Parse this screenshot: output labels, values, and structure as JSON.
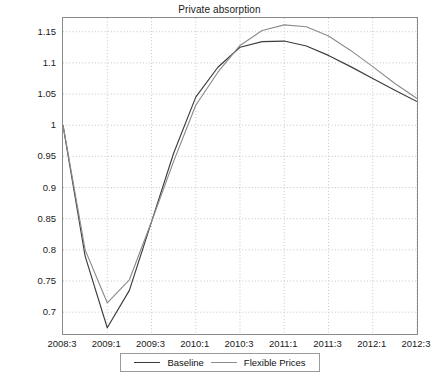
{
  "chart_data": {
    "type": "line",
    "title": "Private absorption",
    "xlabel": "",
    "ylabel": "",
    "grid": true,
    "legend_position": "bottom-center",
    "x": [
      "2008:3",
      "2008:4",
      "2009:1",
      "2009:2",
      "2009:3",
      "2009:4",
      "2010:1",
      "2010:2",
      "2010:3",
      "2010:4",
      "2011:1",
      "2011:2",
      "2011:3",
      "2011:4",
      "2012:1",
      "2012:2",
      "2012:3"
    ],
    "xticks": [
      "2008:3",
      "2009:1",
      "2009:3",
      "2010:1",
      "2010:3",
      "2011:1",
      "2011:3",
      "2012:1",
      "2012:3"
    ],
    "yticks": [
      0.7,
      0.75,
      0.8,
      0.85,
      0.9,
      0.95,
      1,
      1.05,
      1.1,
      1.15
    ],
    "ytick_labels": [
      "0.7",
      "0.75",
      "0.8",
      "0.85",
      "0.9",
      "0.95",
      "1",
      "1.05",
      "1.1",
      "1.15"
    ],
    "ylim": [
      0.665,
      1.172
    ],
    "xlim": [
      0,
      16
    ],
    "series": [
      {
        "name": "Baseline",
        "color": "#3c3c3c",
        "values": [
          1.0,
          0.79,
          0.675,
          0.735,
          0.845,
          0.955,
          1.045,
          1.093,
          1.125,
          1.134,
          1.135,
          1.127,
          1.112,
          1.094,
          1.075,
          1.056,
          1.038
        ]
      },
      {
        "name": "Flexible Prices",
        "color": "#8c8c8c",
        "values": [
          1.0,
          0.8,
          0.715,
          0.752,
          0.845,
          0.942,
          1.032,
          1.085,
          1.128,
          1.152,
          1.161,
          1.158,
          1.143,
          1.12,
          1.094,
          1.067,
          1.043
        ]
      }
    ]
  },
  "legend": {
    "items": [
      {
        "label": "Baseline",
        "color": "#3c3c3c"
      },
      {
        "label": "Flexible Prices",
        "color": "#8c8c8c"
      }
    ]
  },
  "axes": {
    "grid_color": "#b9b9b9",
    "frame_color": "#8a8a8a"
  }
}
